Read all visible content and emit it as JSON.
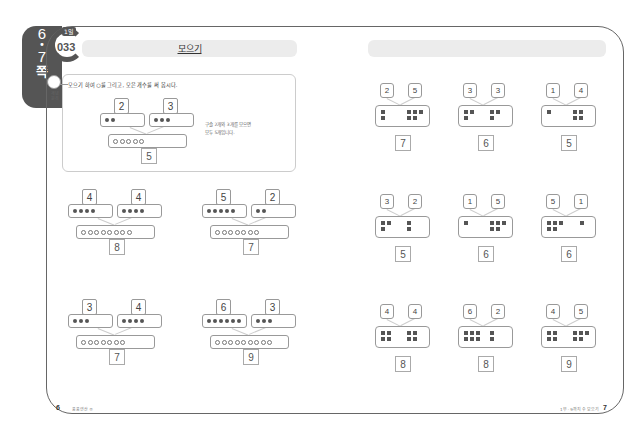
{
  "side_tab": {
    "page_top": "6",
    "page_bottom": "7",
    "word": "쪽"
  },
  "left_page": {
    "lesson": {
      "day": "1일",
      "number": "033"
    },
    "title": "모으기",
    "concept_label": "개념원리",
    "instruction": "모으기 하여 ○를 그리고, 모은 개수를 써 봅시다.",
    "example": {
      "left": 2,
      "right": 3,
      "total": 5,
      "note_line1": "구슬 2개와 3개를 모으면",
      "note_line2": "모두 5개입니다."
    },
    "problems": [
      {
        "left": 4,
        "right": 4,
        "total": 8
      },
      {
        "left": 5,
        "right": 2,
        "total": 7
      },
      {
        "left": 3,
        "right": 4,
        "total": 7
      },
      {
        "left": 6,
        "right": 3,
        "total": 9
      }
    ],
    "footer": {
      "page_number": "6",
      "text": "풍풍연산 ⑤"
    }
  },
  "right_page": {
    "title": "",
    "problems": [
      {
        "left": 2,
        "right": 5,
        "total": 7
      },
      {
        "left": 3,
        "right": 3,
        "total": 6
      },
      {
        "left": 1,
        "right": 4,
        "total": 5
      },
      {
        "left": 3,
        "right": 2,
        "total": 5
      },
      {
        "left": 1,
        "right": 5,
        "total": 6
      },
      {
        "left": 5,
        "right": 1,
        "total": 6
      },
      {
        "left": 4,
        "right": 4,
        "total": 8
      },
      {
        "left": 6,
        "right": 2,
        "total": 8
      },
      {
        "left": 4,
        "right": 5,
        "total": 9
      }
    ],
    "footer": {
      "page_number": "7",
      "text": "1부 · 9까지 수 모으기"
    }
  },
  "colors": {
    "frame": "#666666",
    "tab": "#555555",
    "title_bar": "#ececec",
    "dot": "#555555"
  }
}
